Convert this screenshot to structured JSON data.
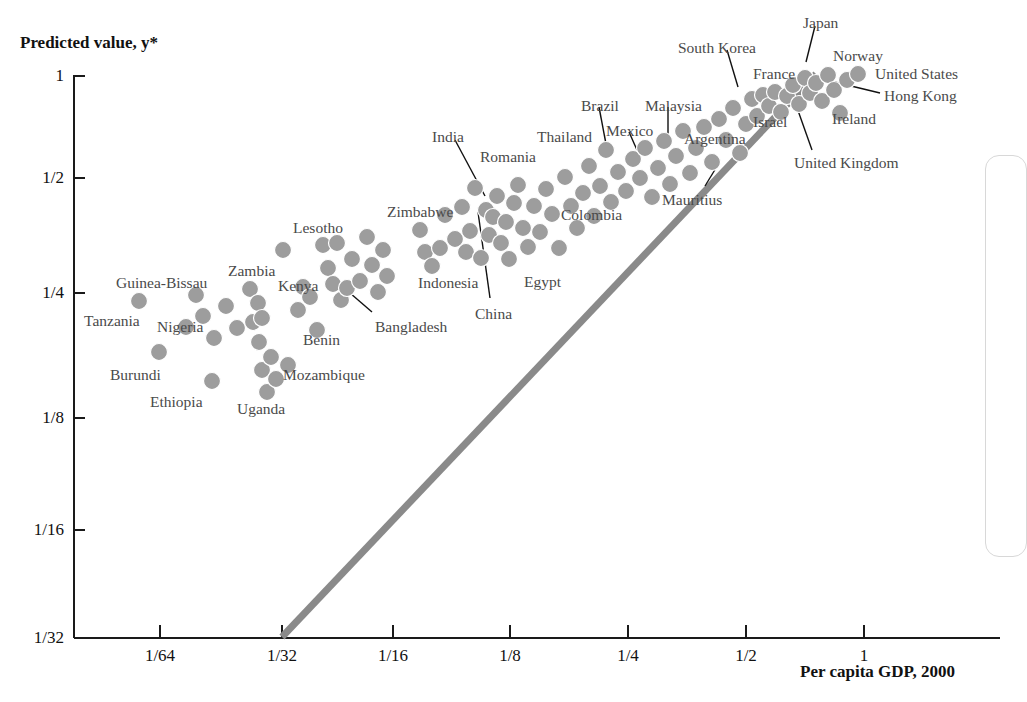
{
  "chart_data": {
    "type": "scatter",
    "title": "",
    "xlabel": "Per capita GDP, 2000",
    "ylabel": "Predicted value, y*",
    "scale": "log2",
    "xticks": [
      "1/64",
      "1/32",
      "1/16",
      "1/8",
      "1/4",
      "1/2",
      "1"
    ],
    "xtick_values": [
      0.015625,
      0.03125,
      0.0625,
      0.125,
      0.25,
      0.5,
      1
    ],
    "yticks": [
      "1",
      "1/2",
      "1/4",
      "1/8",
      "1/16",
      "1/32"
    ],
    "ytick_values": [
      1,
      0.5,
      0.25,
      0.125,
      0.0625,
      0.03125
    ],
    "xlim": [
      0.0078125,
      1.6
    ],
    "ylim": [
      0.03125,
      1.0
    ],
    "grid": false,
    "legend": null,
    "reference_line": {
      "name": "45-degree line",
      "color": "#8a8a8a",
      "width": 7,
      "from": {
        "x": 0.03125,
        "y": 0.03125
      },
      "to": {
        "x": 0.93,
        "y": 0.96
      }
    },
    "marker": {
      "shape": "circle",
      "color": "#9d9d9d",
      "size": 17
    },
    "points": [
      {
        "px": 139,
        "py": 301
      },
      {
        "px": 159,
        "py": 352
      },
      {
        "px": 186,
        "py": 327
      },
      {
        "px": 196,
        "py": 295
      },
      {
        "px": 203,
        "py": 316
      },
      {
        "px": 212,
        "py": 381
      },
      {
        "px": 214,
        "py": 338
      },
      {
        "px": 226,
        "py": 306
      },
      {
        "px": 237,
        "py": 328
      },
      {
        "px": 250,
        "py": 289
      },
      {
        "px": 253,
        "py": 322
      },
      {
        "px": 258,
        "py": 303
      },
      {
        "px": 259,
        "py": 342
      },
      {
        "px": 262,
        "py": 318
      },
      {
        "px": 262,
        "py": 370
      },
      {
        "px": 267,
        "py": 392
      },
      {
        "px": 271,
        "py": 357
      },
      {
        "px": 276,
        "py": 379
      },
      {
        "px": 283,
        "py": 250
      },
      {
        "px": 288,
        "py": 365
      },
      {
        "px": 298,
        "py": 310
      },
      {
        "px": 303,
        "py": 287
      },
      {
        "px": 310,
        "py": 297
      },
      {
        "px": 317,
        "py": 330
      },
      {
        "px": 323,
        "py": 245
      },
      {
        "px": 328,
        "py": 268
      },
      {
        "px": 333,
        "py": 284
      },
      {
        "px": 337,
        "py": 243
      },
      {
        "px": 341,
        "py": 300
      },
      {
        "px": 347,
        "py": 288
      },
      {
        "px": 352,
        "py": 259
      },
      {
        "px": 360,
        "py": 281
      },
      {
        "px": 367,
        "py": 237
      },
      {
        "px": 372,
        "py": 265
      },
      {
        "px": 378,
        "py": 292
      },
      {
        "px": 383,
        "py": 250
      },
      {
        "px": 387,
        "py": 276
      },
      {
        "px": 420,
        "py": 230
      },
      {
        "px": 425,
        "py": 252
      },
      {
        "px": 432,
        "py": 266
      },
      {
        "px": 440,
        "py": 248
      },
      {
        "px": 445,
        "py": 215
      },
      {
        "px": 455,
        "py": 239
      },
      {
        "px": 462,
        "py": 207
      },
      {
        "px": 466,
        "py": 252
      },
      {
        "px": 470,
        "py": 231
      },
      {
        "px": 475,
        "py": 188
      },
      {
        "px": 481,
        "py": 258
      },
      {
        "px": 486,
        "py": 210
      },
      {
        "px": 489,
        "py": 235
      },
      {
        "px": 493,
        "py": 217
      },
      {
        "px": 497,
        "py": 196
      },
      {
        "px": 501,
        "py": 243
      },
      {
        "px": 506,
        "py": 222
      },
      {
        "px": 509,
        "py": 259
      },
      {
        "px": 514,
        "py": 203
      },
      {
        "px": 518,
        "py": 185
      },
      {
        "px": 523,
        "py": 228
      },
      {
        "px": 528,
        "py": 247
      },
      {
        "px": 534,
        "py": 206
      },
      {
        "px": 540,
        "py": 232
      },
      {
        "px": 546,
        "py": 189
      },
      {
        "px": 552,
        "py": 214
      },
      {
        "px": 559,
        "py": 248
      },
      {
        "px": 565,
        "py": 177
      },
      {
        "px": 571,
        "py": 206
      },
      {
        "px": 577,
        "py": 228
      },
      {
        "px": 583,
        "py": 193
      },
      {
        "px": 589,
        "py": 166
      },
      {
        "px": 594,
        "py": 216
      },
      {
        "px": 600,
        "py": 186
      },
      {
        "px": 606,
        "py": 150
      },
      {
        "px": 611,
        "py": 202
      },
      {
        "px": 618,
        "py": 172
      },
      {
        "px": 626,
        "py": 191
      },
      {
        "px": 633,
        "py": 159
      },
      {
        "px": 640,
        "py": 178
      },
      {
        "px": 645,
        "py": 148
      },
      {
        "px": 652,
        "py": 197
      },
      {
        "px": 658,
        "py": 168
      },
      {
        "px": 664,
        "py": 141
      },
      {
        "px": 670,
        "py": 184
      },
      {
        "px": 676,
        "py": 156
      },
      {
        "px": 683,
        "py": 131
      },
      {
        "px": 690,
        "py": 173
      },
      {
        "px": 696,
        "py": 148
      },
      {
        "px": 704,
        "py": 127
      },
      {
        "px": 712,
        "py": 162
      },
      {
        "px": 719,
        "py": 119
      },
      {
        "px": 726,
        "py": 140
      },
      {
        "px": 733,
        "py": 108
      },
      {
        "px": 740,
        "py": 153
      },
      {
        "px": 746,
        "py": 124
      },
      {
        "px": 752,
        "py": 99
      },
      {
        "px": 757,
        "py": 116
      },
      {
        "px": 763,
        "py": 95
      },
      {
        "px": 769,
        "py": 106
      },
      {
        "px": 775,
        "py": 92
      },
      {
        "px": 781,
        "py": 112
      },
      {
        "px": 787,
        "py": 96
      },
      {
        "px": 793,
        "py": 85
      },
      {
        "px": 799,
        "py": 104
      },
      {
        "px": 805,
        "py": 78
      },
      {
        "px": 810,
        "py": 93
      },
      {
        "px": 816,
        "py": 83
      },
      {
        "px": 822,
        "py": 101
      },
      {
        "px": 828,
        "py": 75
      },
      {
        "px": 834,
        "py": 90
      },
      {
        "px": 840,
        "py": 113
      },
      {
        "px": 847,
        "py": 80
      },
      {
        "px": 858,
        "py": 74
      }
    ],
    "annotations": [
      {
        "label": "Tanzania",
        "lx": 84,
        "ly": 312,
        "align": "start",
        "leader": null
      },
      {
        "label": "Guinea-Bissau",
        "lx": 116,
        "ly": 274,
        "align": "start",
        "leader": null
      },
      {
        "label": "Nigeria",
        "lx": 157,
        "ly": 318,
        "align": "start",
        "leader": null
      },
      {
        "label": "Burundi",
        "lx": 110,
        "ly": 366,
        "align": "start",
        "leader": null
      },
      {
        "label": "Ethiopia",
        "lx": 150,
        "ly": 393,
        "align": "start",
        "leader": null
      },
      {
        "label": "Zambia",
        "lx": 228,
        "ly": 262,
        "align": "start",
        "leader": null
      },
      {
        "label": "Uganda",
        "lx": 237,
        "ly": 400,
        "align": "start",
        "leader": null
      },
      {
        "label": "Kenya",
        "lx": 278,
        "ly": 277,
        "align": "start",
        "leader": null
      },
      {
        "label": "Mozambique",
        "lx": 283,
        "ly": 366,
        "align": "start",
        "leader": null
      },
      {
        "label": "Benin",
        "lx": 303,
        "ly": 331,
        "align": "start",
        "leader": null
      },
      {
        "label": "Lesotho",
        "lx": 293,
        "ly": 219,
        "align": "start",
        "leader": null
      },
      {
        "label": "Bangladesh",
        "lx": 375,
        "ly": 318,
        "align": "start",
        "leader": {
          "x1": 372,
          "y1": 312,
          "x2": 343,
          "y2": 287
        }
      },
      {
        "label": "Zimbabwe",
        "lx": 387,
        "ly": 203,
        "align": "start",
        "leader": null
      },
      {
        "label": "Indonesia",
        "lx": 418,
        "ly": 274,
        "align": "start",
        "leader": null
      },
      {
        "label": "India",
        "lx": 432,
        "ly": 128,
        "align": "start",
        "leader": {
          "x1": 455,
          "y1": 140,
          "x2": 485,
          "y2": 196
        }
      },
      {
        "label": "China",
        "lx": 475,
        "ly": 305,
        "align": "start",
        "leader": {
          "x1": 490,
          "y1": 298,
          "x2": 478,
          "y2": 212
        }
      },
      {
        "label": "Romania",
        "lx": 480,
        "ly": 148,
        "align": "start",
        "leader": null
      },
      {
        "label": "Egypt",
        "lx": 524,
        "ly": 273,
        "align": "start",
        "leader": null
      },
      {
        "label": "Colombia",
        "lx": 561,
        "ly": 206,
        "align": "start",
        "leader": null
      },
      {
        "label": "Thailand",
        "lx": 537,
        "ly": 128,
        "align": "start",
        "leader": null
      },
      {
        "label": "Brazil",
        "lx": 581,
        "ly": 97,
        "align": "start",
        "leader": {
          "x1": 599,
          "y1": 107,
          "x2": 606,
          "y2": 144
        }
      },
      {
        "label": "Mexico",
        "lx": 606,
        "ly": 122,
        "align": "start",
        "leader": {
          "x1": 629,
          "y1": 132,
          "x2": 637,
          "y2": 150
        }
      },
      {
        "label": "Malaysia",
        "lx": 645,
        "ly": 97,
        "align": "start",
        "leader": {
          "x1": 668,
          "y1": 107,
          "x2": 668,
          "y2": 145
        }
      },
      {
        "label": "Argentina",
        "lx": 684,
        "ly": 130,
        "align": "start",
        "leader": null
      },
      {
        "label": "Mauritius",
        "lx": 662,
        "ly": 191,
        "align": "start",
        "leader": {
          "x1": 705,
          "y1": 186,
          "x2": 716,
          "y2": 168
        }
      },
      {
        "label": "South Korea",
        "lx": 678,
        "ly": 39,
        "align": "start",
        "leader": {
          "x1": 727,
          "y1": 50,
          "x2": 738,
          "y2": 87
        }
      },
      {
        "label": "Israel",
        "lx": 753,
        "ly": 113,
        "align": "start",
        "leader": null
      },
      {
        "label": "France",
        "lx": 753,
        "ly": 65,
        "align": "start",
        "leader": null
      },
      {
        "label": "Japan",
        "lx": 803,
        "ly": 14,
        "align": "start",
        "leader": {
          "x1": 815,
          "y1": 26,
          "x2": 806,
          "y2": 62
        }
      },
      {
        "label": "Norway",
        "lx": 833,
        "ly": 47,
        "align": "start",
        "leader": null
      },
      {
        "label": "United States",
        "lx": 875,
        "ly": 65,
        "align": "start",
        "leader": null
      },
      {
        "label": "Hong Kong",
        "lx": 884,
        "ly": 87,
        "align": "start",
        "leader": {
          "x1": 880,
          "y1": 93,
          "x2": 818,
          "y2": 78
        }
      },
      {
        "label": "Ireland",
        "lx": 832,
        "ly": 110,
        "align": "start",
        "leader": null
      },
      {
        "label": "United Kingdom",
        "lx": 794,
        "ly": 154,
        "align": "start",
        "leader": {
          "x1": 812,
          "y1": 150,
          "x2": 790,
          "y2": 88
        }
      }
    ]
  },
  "side_panel": {
    "present": true
  }
}
